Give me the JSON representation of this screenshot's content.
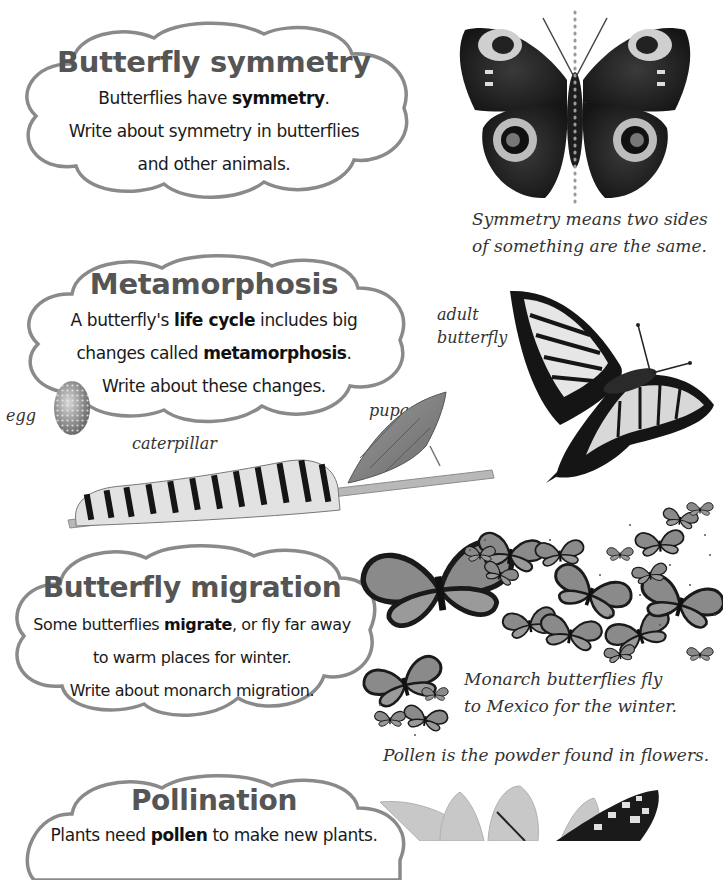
{
  "colors": {
    "cloud_outline": "#8a8a8a",
    "title": "#555555",
    "body_text": "#1a1a1a",
    "caption": "#333333"
  },
  "sections": [
    {
      "id": "symmetry",
      "title": "Butterfly symmetry",
      "lines": [
        {
          "pre": "Butterflies have ",
          "bold": "symmetry",
          "post": "."
        },
        {
          "pre": "Write about symmetry in butterflies",
          "bold": "",
          "post": ""
        },
        {
          "pre": "and other animals.",
          "bold": "",
          "post": ""
        }
      ],
      "image": "peacock-butterfly-icon",
      "caption_lines": [
        "Symmetry means two sides",
        "of something are the same."
      ]
    },
    {
      "id": "metamorphosis",
      "title": "Metamorphosis",
      "lines": [
        {
          "pre": "A butterfly's ",
          "bold": "life cycle",
          "post": " includes big"
        },
        {
          "pre": "changes called ",
          "bold": "metamorphosis",
          "post": "."
        },
        {
          "pre": "Write about these changes.",
          "bold": "",
          "post": ""
        }
      ],
      "labels": {
        "egg": "egg",
        "caterpillar": "caterpillar",
        "pupa": "pupa",
        "adult_line1": "adult",
        "adult_line2": "butterfly"
      },
      "images": [
        "egg-icon",
        "caterpillar-icon",
        "pupa-icon",
        "swallowtail-butterfly-icon"
      ]
    },
    {
      "id": "migration",
      "title": "Butterfly migration",
      "lines": [
        {
          "pre": "Some butterflies ",
          "bold": "migrate",
          "post": ", or fly far away"
        },
        {
          "pre": "to warm places for winter.",
          "bold": "",
          "post": ""
        },
        {
          "pre": "Write about monarch migration.",
          "bold": "",
          "post": ""
        }
      ],
      "image": "monarch-swarm-icon",
      "caption_lines": [
        "Monarch butterflies fly",
        "to Mexico for the winter."
      ]
    },
    {
      "id": "pollination",
      "title": "Pollination",
      "lines": [
        {
          "pre": "Plants need ",
          "bold": "pollen",
          "post": " to make new plants."
        }
      ],
      "image": "flower-butterfly-icon",
      "caption_lines": [
        "Pollen is the powder found in flowers."
      ]
    }
  ]
}
